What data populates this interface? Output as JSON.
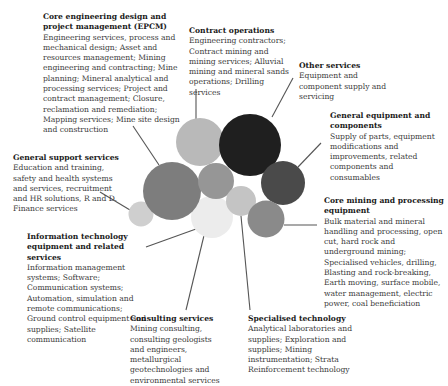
{
  "diagram": {
    "type": "bubble-cluster",
    "categories": [
      {
        "id": "epcm",
        "title": "Core engineering design and project management (EPCM)",
        "description": "Engineering services, process and mechanical design; Asset and resources management; Mining engineering and contracting; Mine planning; Mineral analytical and processing services; Project and contract management; Closure, reclamation and remediation; Mapping services; Mine site design and construction",
        "color": "#7d7d7d"
      },
      {
        "id": "contract-operations",
        "title": "Contract operations",
        "description": "Engineering contractors; Contract mining and mining services; Alluvial mining and mineral sands operations; Drilling services",
        "color": "#b9b9b9"
      },
      {
        "id": "other-services",
        "title": "Other services",
        "description": "Equipment and component supply and servicing",
        "color": "#1f1f1f"
      },
      {
        "id": "general-equipment",
        "title": "General equipment and components",
        "description": "Supply of parts, equipment modifications and improvements, related components and consumables",
        "color": "#4a4a4a"
      },
      {
        "id": "general-support",
        "title": "General support services",
        "description": "Education and training, safety and health systems and services, recruitment and HR solutions, R and D. Finance services",
        "color": "#cfcfcf"
      },
      {
        "id": "core-mining",
        "title": "Core mining and processing equipment",
        "description": "Bulk material and mineral handling and processing, open cut, hard rock and underground mining; Specialised vehicles, drilling, Blasting and rock-breaking, Earth moving, surface mobile, water management, electric power, coal beneficiation",
        "color": "#8a8a8a"
      },
      {
        "id": "it",
        "title": "Information technology equipment and related services",
        "description": "Information management systems; Software; Communication systems; Automation, simulation and remote communications; Ground control equipment and supplies; Satellite communication",
        "color": "#ececec"
      },
      {
        "id": "consulting",
        "title": "Consulting services",
        "description": "Mining consulting, consulting geologists and engineers, metallurgical geotechnologies and environmental services",
        "color": "#969696"
      },
      {
        "id": "specialised-technology",
        "title": "Specialised technology",
        "description": "Analytical laboratories and supplies; Exploration and supplies; Mining instrumentation; Strata Reinforcement technology",
        "color": "#c4c4c4"
      }
    ]
  }
}
